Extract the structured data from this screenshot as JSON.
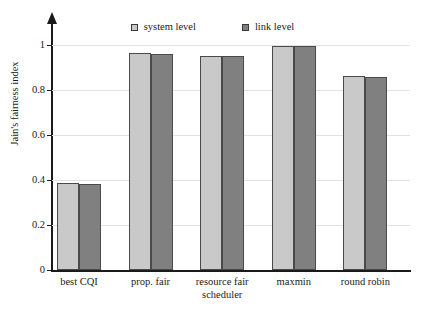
{
  "chart_data": {
    "type": "bar",
    "title": "",
    "xlabel": "",
    "ylabel": "Jain's fairness index",
    "ylim": [
      0,
      1.05
    ],
    "ytick_values": [
      0,
      0.2,
      0.4,
      0.6,
      0.8,
      1
    ],
    "ytick_labels": [
      "0",
      "0.2",
      "0.4",
      "0.6",
      "0.8",
      "1"
    ],
    "grid": true,
    "legend_position": "top-center",
    "categories": [
      "best CQI",
      "prop. fair",
      "resource fair\nscheduler",
      "maxmin",
      "round robin"
    ],
    "category_lines": [
      [
        "best CQI"
      ],
      [
        "prop. fair"
      ],
      [
        "resource fair",
        "scheduler"
      ],
      [
        "maxmin"
      ],
      [
        "round robin"
      ]
    ],
    "series": [
      {
        "name": "system level",
        "color": "#c9c9c9",
        "values": [
          0.387,
          0.965,
          0.951,
          0.996,
          0.862
        ]
      },
      {
        "name": "link level",
        "color": "#808080",
        "values": [
          0.382,
          0.96,
          0.949,
          0.996,
          0.858
        ]
      }
    ]
  },
  "legend": {
    "entries": [
      {
        "label": "system level",
        "swatch": "light-gray-square"
      },
      {
        "label": "link level",
        "swatch": "dark-gray-square"
      }
    ]
  },
  "axes": {
    "y_title": "Jain's fairness index",
    "y_ticks": [
      "1",
      "0.8",
      "0.6",
      "0.4",
      "0.2",
      "0"
    ],
    "x_categories": [
      "best CQI",
      "prop. fair",
      "resource fair",
      "scheduler",
      "maxmin",
      "round robin"
    ]
  },
  "colors": {
    "series_system": "#c9c9c9",
    "series_link": "#808080",
    "axis": "#1a1a1a",
    "grid": "#e2e2e2",
    "background": "#ffffff",
    "bar_border": "#4a4a4a"
  }
}
